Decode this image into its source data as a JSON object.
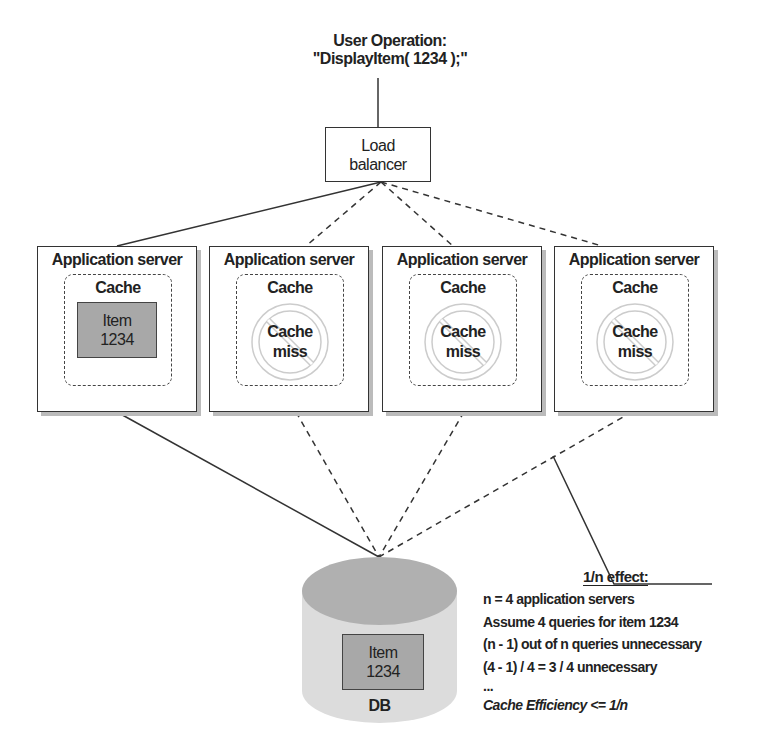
{
  "diagram": {
    "title": {
      "line1": "User Operation:",
      "line2": "\"DisplayItem( 1234 );\""
    },
    "load_balancer": {
      "line1": "Load",
      "line2": "balancer"
    },
    "servers": [
      {
        "title": "Application server",
        "cache_label": "Cache",
        "state": "hit",
        "item_line1": "Item",
        "item_line2": "1234"
      },
      {
        "title": "Application server",
        "cache_label": "Cache",
        "state": "miss",
        "miss_line1": "Cache",
        "miss_line2": "miss"
      },
      {
        "title": "Application server",
        "cache_label": "Cache",
        "state": "miss",
        "miss_line1": "Cache",
        "miss_line2": "miss"
      },
      {
        "title": "Application server",
        "cache_label": "Cache",
        "state": "miss",
        "miss_line1": "Cache",
        "miss_line2": "miss"
      }
    ],
    "database": {
      "item_line1": "Item",
      "item_line2": "1234",
      "label": "DB"
    },
    "annotation": {
      "heading": "1/n effect:",
      "lines": [
        "n = 4 application servers",
        "Assume 4 queries for item 1234",
        "(n - 1) out of n queries unnecessary",
        "(4 - 1) / 4 = 3 / 4 unnecessary",
        "...",
        "Cache Efficiency <= 1/n"
      ]
    },
    "connections": [
      {
        "from": "user-operation",
        "to": "load-balancer",
        "style": "solid"
      },
      {
        "from": "load-balancer",
        "to": "server-1",
        "style": "solid"
      },
      {
        "from": "load-balancer",
        "to": "server-2",
        "style": "dashed"
      },
      {
        "from": "load-balancer",
        "to": "server-3",
        "style": "dashed"
      },
      {
        "from": "load-balancer",
        "to": "server-4",
        "style": "dashed"
      },
      {
        "from": "server-1",
        "to": "db",
        "style": "solid"
      },
      {
        "from": "server-2",
        "to": "db",
        "style": "dashed"
      },
      {
        "from": "server-3",
        "to": "db",
        "style": "dashed"
      },
      {
        "from": "server-4",
        "to": "db",
        "style": "dashed"
      }
    ],
    "colors": {
      "item_fill": "#a8a8a8",
      "db_top": "#b0b0b0",
      "db_body": "#dcdcdc",
      "stroke": "#333333"
    }
  }
}
